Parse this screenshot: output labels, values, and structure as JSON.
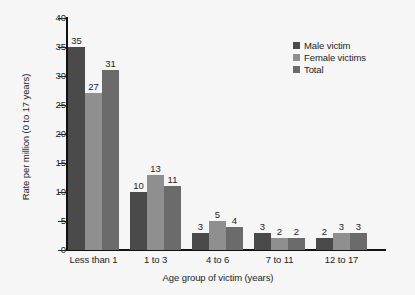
{
  "chart_data": {
    "type": "bar",
    "title": "",
    "xlabel": "Age group of victim (years)",
    "ylabel": "Rate per million (0 to 17 years)",
    "categories": [
      "Less than 1",
      "1 to 3",
      "4 to 6",
      "7 to 11",
      "12 to 17"
    ],
    "series": [
      {
        "name": "Male victim",
        "color": "#4a4a4a",
        "values": [
          35,
          10,
          3,
          3,
          2
        ]
      },
      {
        "name": "Female victims",
        "color": "#8f8f8f",
        "values": [
          27,
          13,
          5,
          2,
          3
        ]
      },
      {
        "name": "Total",
        "color": "#6b6b6b",
        "values": [
          31,
          11,
          4,
          2,
          3
        ]
      }
    ],
    "ylim": [
      0,
      40
    ],
    "yticks": [
      0,
      5,
      10,
      15,
      20,
      25,
      30,
      35,
      40
    ],
    "grid": false,
    "legend_position": "top-right",
    "data_labels": true
  },
  "colors": {
    "background": "#f6f6f6",
    "axis": "#111111",
    "text": "#1d1d1d"
  }
}
